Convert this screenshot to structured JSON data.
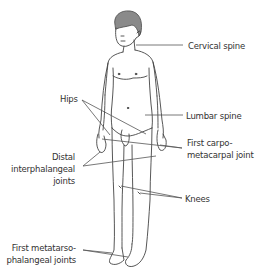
{
  "figure": {
    "title": "",
    "line_color": "#444444",
    "hair_color": "#777777",
    "labels": [
      {
        "id": "cervical",
        "lines": [
          "Cervical spine"
        ]
      },
      {
        "id": "hips",
        "lines": [
          "Hips"
        ]
      },
      {
        "id": "lumbar",
        "lines": [
          "Lumbar spine"
        ]
      },
      {
        "id": "cmc",
        "lines": [
          "First carpo-",
          "metacarpal joint"
        ]
      },
      {
        "id": "dip",
        "lines": [
          "Distal",
          "interphalangeal",
          "joints"
        ]
      },
      {
        "id": "knees",
        "lines": [
          "Knees"
        ]
      },
      {
        "id": "mtp",
        "lines": [
          "First metatarso-",
          "phalangeal joints"
        ]
      }
    ]
  }
}
